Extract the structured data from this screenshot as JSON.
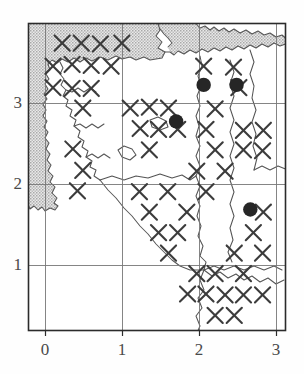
{
  "figure": {
    "kind": "distribution-grid-map",
    "background_color": "#ffffff",
    "ink_color": "#3a3a3a",
    "sea_fill_color": "#c9c9c9",
    "land_fill_color": "#ffffff",
    "frame_color": "#2b2b2b",
    "grid_color": "#6e6e6e",
    "marker_color": "#2b2b2b"
  },
  "chart_data": {
    "type": "scatter",
    "title": "",
    "subtitle": "",
    "xlabel": "",
    "ylabel": "",
    "xlim": [
      -0.22,
      3.14
    ],
    "ylim": [
      0.33,
      3.78
    ],
    "grid": true,
    "legend": null,
    "xticks": [
      0,
      1,
      2,
      3
    ],
    "xticklabels": [
      "0",
      "1",
      "2",
      "3"
    ],
    "yticks": [
      1,
      2,
      3
    ],
    "yticklabels": [
      "1",
      "2",
      "3"
    ],
    "series": [
      {
        "name": "survey-square",
        "marker": "x",
        "values": [
          [
            0.22,
            3.56
          ],
          [
            0.47,
            3.56
          ],
          [
            0.72,
            3.55
          ],
          [
            1.0,
            3.56
          ],
          [
            0.1,
            3.3
          ],
          [
            0.35,
            3.32
          ],
          [
            0.6,
            3.31
          ],
          [
            0.86,
            3.3
          ],
          [
            2.07,
            3.3
          ],
          [
            2.46,
            3.29
          ],
          [
            0.1,
            3.06
          ],
          [
            0.35,
            3.05
          ],
          [
            0.6,
            3.05
          ],
          [
            2.53,
            3.06
          ],
          [
            0.49,
            2.83
          ],
          [
            1.11,
            2.83
          ],
          [
            1.36,
            2.84
          ],
          [
            1.61,
            2.83
          ],
          [
            2.22,
            2.82
          ],
          [
            1.24,
            2.6
          ],
          [
            1.48,
            2.59
          ],
          [
            1.73,
            2.59
          ],
          [
            2.1,
            2.59
          ],
          [
            2.59,
            2.58
          ],
          [
            2.85,
            2.58
          ],
          [
            0.36,
            2.37
          ],
          [
            1.36,
            2.36
          ],
          [
            2.22,
            2.36
          ],
          [
            2.59,
            2.36
          ],
          [
            2.84,
            2.35
          ],
          [
            0.49,
            2.13
          ],
          [
            1.98,
            2.12
          ],
          [
            2.35,
            2.12
          ],
          [
            0.42,
            1.9
          ],
          [
            1.23,
            1.89
          ],
          [
            1.6,
            1.89
          ],
          [
            2.1,
            1.89
          ],
          [
            1.36,
            1.66
          ],
          [
            1.85,
            1.66
          ],
          [
            2.85,
            1.66
          ],
          [
            1.48,
            1.43
          ],
          [
            1.73,
            1.43
          ],
          [
            2.72,
            1.43
          ],
          [
            1.61,
            1.2
          ],
          [
            2.47,
            1.2
          ],
          [
            2.84,
            1.2
          ],
          [
            1.98,
            0.97
          ],
          [
            2.22,
            0.97
          ],
          [
            2.59,
            0.97
          ],
          [
            1.86,
            0.74
          ],
          [
            2.1,
            0.74
          ],
          [
            2.35,
            0.73
          ],
          [
            2.59,
            0.73
          ],
          [
            2.84,
            0.73
          ],
          [
            2.22,
            0.5
          ],
          [
            2.47,
            0.5
          ]
        ]
      },
      {
        "name": "occurrence-record",
        "marker": "filled-circle",
        "values": [
          [
            2.07,
            3.09
          ],
          [
            2.5,
            3.09
          ],
          [
            1.71,
            2.68
          ],
          [
            2.68,
            1.69
          ]
        ]
      }
    ]
  },
  "axes": {
    "x_tick_labels": [
      "0",
      "1",
      "2",
      "3"
    ],
    "y_tick_labels": [
      "1",
      "2",
      "3"
    ]
  }
}
